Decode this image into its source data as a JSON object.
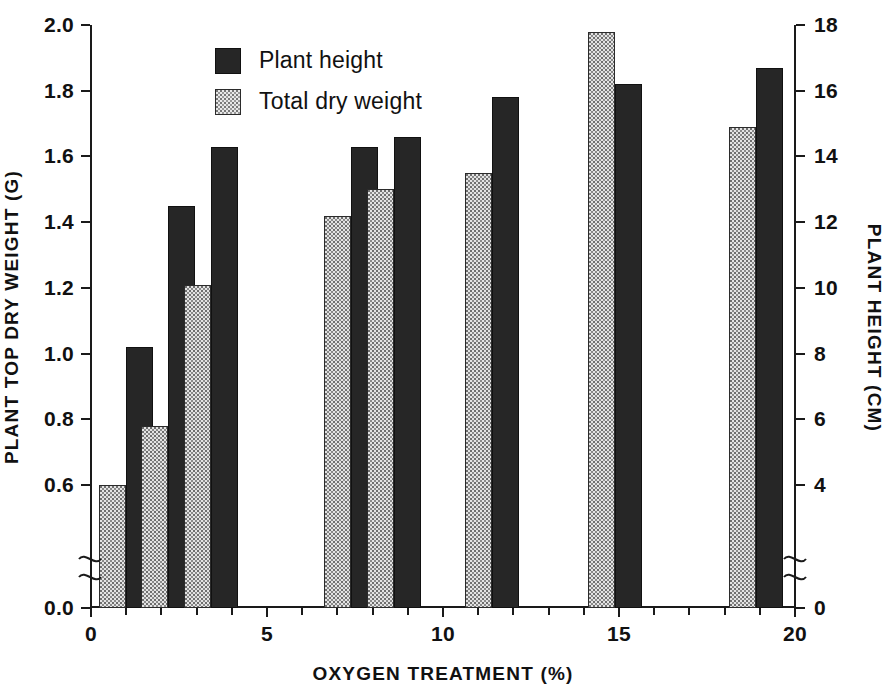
{
  "legend": {
    "position": "top-left",
    "entries": [
      {
        "label": "Plant height",
        "swatch": "dark-stipple",
        "color": "#262626"
      },
      {
        "label": "Total dry weight",
        "swatch": "light-stipple",
        "color": "#e3e3e3"
      }
    ]
  },
  "axes": {
    "left": {
      "title": "PLANT TOP DRY WEIGHT (G)",
      "ticks": [
        "0.0",
        "0.6",
        "0.8",
        "1.0",
        "1.2",
        "1.4",
        "1.6",
        "1.8",
        "2.0"
      ],
      "break_after": "0.0"
    },
    "right": {
      "title": "PLANT HEIGHT (CM)",
      "ticks": [
        "0",
        "4",
        "6",
        "8",
        "10",
        "12",
        "14",
        "16",
        "18"
      ],
      "break_after": "0"
    },
    "bottom": {
      "title": "OXYGEN TREATMENT (%)",
      "ticks": [
        "0",
        "5",
        "10",
        "15",
        "20"
      ]
    }
  },
  "chart_data": {
    "type": "bar",
    "title": "",
    "xlabel": "OXYGEN TREATMENT (%)",
    "ylabel": "PLANT TOP DRY WEIGHT (G)",
    "y2label": "PLANT HEIGHT (CM)",
    "grid": false,
    "legend_position": "top-left",
    "xlim": [
      0,
      20
    ],
    "ylim": [
      0.0,
      2.0
    ],
    "y_axis_break": [
      0.0,
      0.6
    ],
    "ylim2": [
      0,
      18
    ],
    "y2_axis_break": [
      0,
      4
    ],
    "xticks": [
      0,
      5,
      10,
      15,
      20
    ],
    "yticks": [
      0.0,
      0.6,
      0.8,
      1.0,
      1.2,
      1.4,
      1.6,
      1.8,
      2.0
    ],
    "y2ticks": [
      0,
      4,
      6,
      8,
      10,
      12,
      14,
      16,
      18
    ],
    "x": [
      1.0,
      2.2,
      3.4,
      7.4,
      8.6,
      11.4,
      14.9,
      18.9
    ],
    "series": [
      {
        "name": "Total dry weight",
        "axis": "left",
        "unit": "G",
        "values": [
          0.6,
          0.78,
          1.21,
          1.42,
          1.5,
          1.55,
          1.98,
          1.69
        ]
      },
      {
        "name": "Plant height",
        "axis": "right",
        "unit": "CM",
        "values": [
          8.8,
          12.9,
          14.6,
          14.6,
          14.9,
          16.0,
          16.4,
          16.9
        ],
        "values_left_axis_equivalent": [
          1.02,
          1.45,
          1.63,
          1.63,
          1.66,
          1.78,
          1.82,
          1.87
        ]
      }
    ]
  }
}
